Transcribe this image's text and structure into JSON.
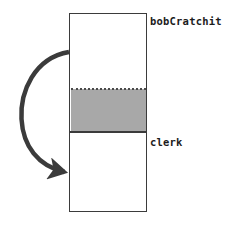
{
  "diagram": {
    "type": "uml-sequence-lifeline",
    "canvas": {
      "width": 233,
      "height": 227,
      "background": "#ffffff"
    },
    "object_box": {
      "name": "lifeline-rectangle",
      "x": 69,
      "y": 13,
      "width": 78,
      "height": 199,
      "fill": "#ffffff",
      "stroke": "#3b3b3b"
    },
    "labels": {
      "top": "bobCratchit",
      "bottom": "clerk"
    },
    "activation_band": {
      "name": "shaded-activation-band",
      "x": 69,
      "y": 89,
      "width": 78,
      "height": 43,
      "fill": "#a8a8a8",
      "top_border_style": "dotted",
      "bottom_border_style": "solid",
      "border_color": "#3b3b3b"
    },
    "self_arrow": {
      "name": "self-call-arrow",
      "style": "curved",
      "color": "#3b3b3b",
      "stroke_width": 4.5,
      "start_x": 69,
      "start_y": 52,
      "end_x": 69,
      "end_y": 172,
      "leftmost_x": 22,
      "arrowhead": "solid-filled-triangle",
      "arrowhead_direction": "right"
    }
  }
}
